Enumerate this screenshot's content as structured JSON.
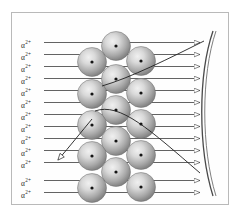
{
  "figure": {
    "border_color": "#b9b9b9",
    "background_color": "#ffffff",
    "ray_color": "#3b3b3b",
    "sphere_edge_color": "#6e6e6e",
    "sphere_fill_light": "#e2e2e2",
    "sphere_fill_dark": "#7d7d7d",
    "nucleus_color": "#141414",
    "screen_color": "#555555"
  },
  "beam": {
    "label_text": "α",
    "label_charge": "2+",
    "labels": [
      {
        "id": "alpha-1",
        "text": "α",
        "charge": "2+",
        "x": 21,
        "y": 40,
        "line_y": 42.5
      },
      {
        "id": "alpha-2",
        "text": "α",
        "charge": "2+",
        "x": 21,
        "y": 52,
        "line_y": 54.5
      },
      {
        "id": "alpha-3",
        "text": "α",
        "charge": "2+",
        "x": 21,
        "y": 64,
        "line_y": 66.5
      },
      {
        "id": "alpha-4",
        "text": "α",
        "charge": "2+",
        "x": 21,
        "y": 76,
        "line_y": 78.5
      },
      {
        "id": "alpha-5",
        "text": "α",
        "charge": "2+",
        "x": 21,
        "y": 88,
        "line_y": 90.5
      },
      {
        "id": "alpha-6",
        "text": "α",
        "charge": "2+",
        "x": 21,
        "y": 100,
        "line_y": 102.5
      },
      {
        "id": "alpha-7",
        "text": "α",
        "charge": "2+",
        "x": 21,
        "y": 112,
        "line_y": 114.5
      },
      {
        "id": "alpha-8",
        "text": "α",
        "charge": "2+",
        "x": 21,
        "y": 124,
        "line_y": 126.5
      },
      {
        "id": "alpha-9",
        "text": "α",
        "charge": "2+",
        "x": 21,
        "y": 136,
        "line_y": 138.5
      },
      {
        "id": "alpha-10",
        "text": "α",
        "charge": "2+",
        "x": 21,
        "y": 148,
        "line_y": 150.5
      },
      {
        "id": "alpha-11",
        "text": "α",
        "charge": "2+",
        "x": 21,
        "y": 160,
        "line_y": 162.5
      },
      {
        "id": "alpha-12",
        "text": "α",
        "charge": "2+",
        "x": 21,
        "y": 178,
        "line_y": 180.5
      },
      {
        "id": "alpha-13",
        "text": "α",
        "charge": "2+",
        "x": 21,
        "y": 190,
        "line_y": 192.5
      }
    ],
    "ray_start_x": 44,
    "ray_end_x": 200,
    "count": 13
  },
  "foil": {
    "name": "metal-foil-atoms",
    "atom_radius": 14.5,
    "nucleus_radius": 1.6,
    "atoms": [
      {
        "cx": 116,
        "cy": 46
      },
      {
        "cx": 92,
        "cy": 62
      },
      {
        "cx": 141,
        "cy": 61
      },
      {
        "cx": 116,
        "cy": 79
      },
      {
        "cx": 92,
        "cy": 94
      },
      {
        "cx": 141,
        "cy": 93
      },
      {
        "cx": 116,
        "cy": 110
      },
      {
        "cx": 92,
        "cy": 125
      },
      {
        "cx": 141,
        "cy": 124
      },
      {
        "cx": 116,
        "cy": 141
      },
      {
        "cx": 92,
        "cy": 156
      },
      {
        "cx": 141,
        "cy": 155
      },
      {
        "cx": 116,
        "cy": 172
      },
      {
        "cx": 92,
        "cy": 188
      },
      {
        "cx": 141,
        "cy": 187
      }
    ],
    "count": 15
  },
  "detector": {
    "name": "curved-fluorescent-screen",
    "path": "M 213 31 C 198 75, 198 148, 213 196",
    "inner_path": "M 216 31 C 201 75, 201 148, 216 196",
    "arrow_count": 13
  },
  "scattered": {
    "deflected_forward": {
      "name": "small-angle-deflection-path",
      "path": "M 102 86 C 130 78, 170 58, 204 41",
      "description": "alpha particle deflected slightly by nucleus toward upper screen"
    },
    "deflected_large": {
      "name": "large-angle-deflection-path",
      "path": "M 95 111 C 120 102, 150 130, 200 173",
      "description": "alpha particle deflected at a large angle toward lower screen"
    },
    "backscattered": {
      "name": "backscattered-path",
      "path": "M 92 119 C 82 131, 70 146, 58 160",
      "arrow_tip": [
        55,
        163
      ],
      "description": "alpha particle bounced back from nucleus"
    }
  }
}
